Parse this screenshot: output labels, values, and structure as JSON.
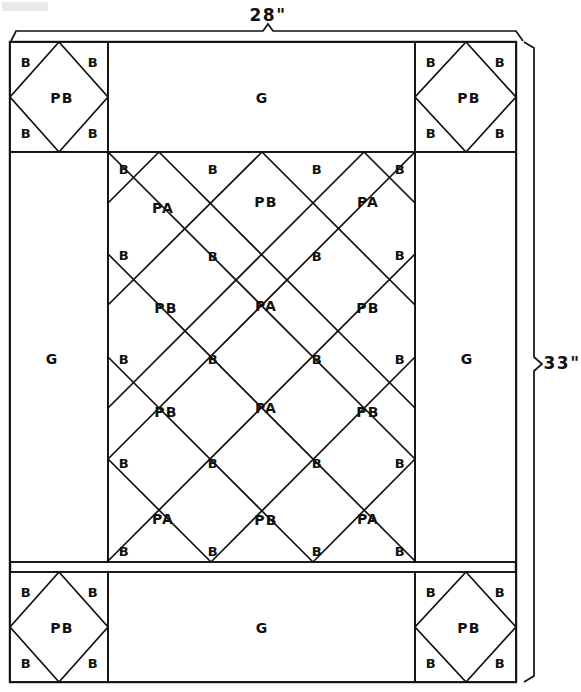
{
  "diagram": {
    "fabric_codes": {
      "border": "G",
      "background_triangle": "B",
      "print_a": "PA",
      "print_b": "PB"
    },
    "dimensions": {
      "width_label": "28\"",
      "height_label": "33\""
    },
    "corner_blocks": [
      {
        "position": "top-left",
        "center": "PB",
        "corners": [
          "B",
          "B",
          "B",
          "B"
        ]
      },
      {
        "position": "top-right",
        "center": "PB",
        "corners": [
          "B",
          "B",
          "B",
          "B"
        ]
      },
      {
        "position": "bottom-left",
        "center": "PB",
        "corners": [
          "B",
          "B",
          "B",
          "B"
        ]
      },
      {
        "position": "bottom-right",
        "center": "PB",
        "corners": [
          "B",
          "B",
          "B",
          "B"
        ]
      }
    ],
    "border_panels": [
      {
        "position": "top",
        "label": "G"
      },
      {
        "position": "left",
        "label": "G"
      },
      {
        "position": "right",
        "label": "G"
      },
      {
        "position": "bottom",
        "label": "G"
      }
    ],
    "center_panel": {
      "columns": 3,
      "rows": 4,
      "diamond_rows": [
        [
          "PA",
          "PB",
          "PA"
        ],
        [
          "PB",
          "PA",
          "PB"
        ],
        [
          "PB",
          "PA",
          "PB"
        ],
        [
          "PA",
          "PB",
          "PA"
        ]
      ],
      "edge_triangle_label": "B",
      "top_edge_triangles": [
        "B",
        "B",
        "B",
        "B"
      ],
      "bottom_edge_triangles": [
        "B",
        "B",
        "B",
        "B"
      ],
      "side_triangle_rows": [
        [
          "B",
          "B"
        ],
        [
          "B",
          "B"
        ],
        [
          "B",
          "B"
        ]
      ],
      "interior_triangle_rows": [
        [
          "B",
          "B"
        ],
        [
          "B",
          "B"
        ],
        [
          "B",
          "B"
        ]
      ]
    }
  }
}
